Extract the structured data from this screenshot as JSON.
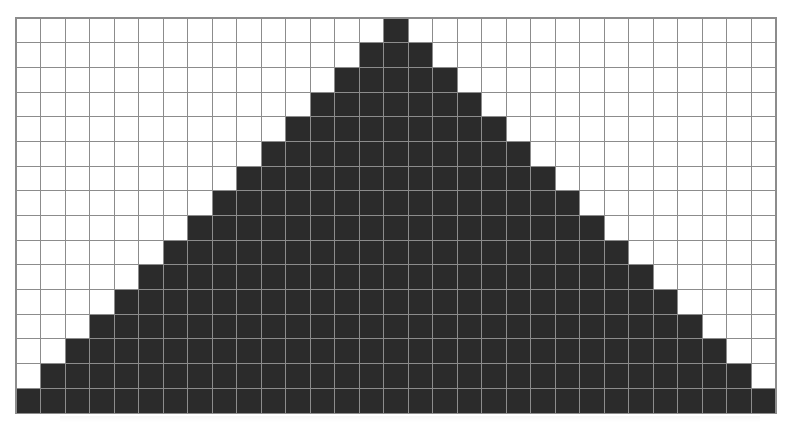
{
  "caption": {
    "text": "",
    "visible": "partially cropped at top edge, illegible"
  },
  "grid": {
    "columns": 31,
    "rows": 16,
    "cell_size_px": 24.5,
    "filled_color": "#2b2b2b",
    "empty_color": "#ffffff",
    "line_color": "#8c8c8c",
    "pattern": "pyramid",
    "rows_filled": [
      {
        "row": 0,
        "start": 15,
        "end": 15
      },
      {
        "row": 1,
        "start": 14,
        "end": 16
      },
      {
        "row": 2,
        "start": 13,
        "end": 17
      },
      {
        "row": 3,
        "start": 12,
        "end": 18
      },
      {
        "row": 4,
        "start": 11,
        "end": 19
      },
      {
        "row": 5,
        "start": 10,
        "end": 20
      },
      {
        "row": 6,
        "start": 9,
        "end": 21
      },
      {
        "row": 7,
        "start": 8,
        "end": 22
      },
      {
        "row": 8,
        "start": 7,
        "end": 23
      },
      {
        "row": 9,
        "start": 6,
        "end": 24
      },
      {
        "row": 10,
        "start": 5,
        "end": 25
      },
      {
        "row": 11,
        "start": 4,
        "end": 26
      },
      {
        "row": 12,
        "start": 3,
        "end": 27
      },
      {
        "row": 13,
        "start": 2,
        "end": 28
      },
      {
        "row": 14,
        "start": 1,
        "end": 29
      },
      {
        "row": 15,
        "start": 0,
        "end": 30
      }
    ]
  }
}
